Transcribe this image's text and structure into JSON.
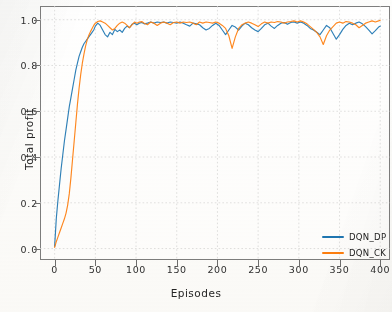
{
  "chart_data": {
    "type": "line",
    "title": "",
    "xlabel": "Episodes",
    "ylabel": "Total profit",
    "xlim": [
      -18,
      412
    ],
    "ylim": [
      -0.05,
      1.06
    ],
    "xticks": [
      0,
      50,
      100,
      150,
      200,
      250,
      300,
      350,
      400
    ],
    "xtick_labels": [
      "0",
      "50",
      "100",
      "150",
      "200",
      "250",
      "300",
      "350",
      "400"
    ],
    "yticks": [
      0.0,
      0.2,
      0.4,
      0.6,
      0.8,
      1.0
    ],
    "ytick_labels": [
      "0.0",
      "0.2",
      "0.4",
      "0.6",
      "0.8",
      "1.0"
    ],
    "grid": true,
    "legend_position": "lower right",
    "colors": {
      "series_1": "#1f77b4",
      "series_2": "#ff7f0e",
      "grid": "#d9d9d9",
      "axis": "#7e7e7e",
      "background": "#ffffff"
    },
    "series": [
      {
        "name": "DQN_DP",
        "color": "#1f77b4",
        "x": [
          0,
          2,
          4,
          6,
          8,
          10,
          12,
          14,
          16,
          18,
          20,
          22,
          24,
          26,
          28,
          30,
          32,
          34,
          36,
          38,
          40,
          42,
          44,
          46,
          48,
          50,
          53,
          56,
          59,
          62,
          65,
          68,
          71,
          74,
          77,
          80,
          83,
          86,
          89,
          92,
          95,
          98,
          101,
          104,
          107,
          110,
          114,
          118,
          122,
          126,
          130,
          134,
          138,
          142,
          146,
          150,
          154,
          158,
          162,
          166,
          170,
          174,
          178,
          182,
          186,
          190,
          194,
          198,
          202,
          206,
          210,
          214,
          218,
          222,
          226,
          230,
          234,
          238,
          242,
          246,
          250,
          254,
          258,
          262,
          266,
          270,
          274,
          278,
          282,
          286,
          290,
          294,
          298,
          302,
          306,
          310,
          314,
          318,
          322,
          326,
          330,
          334,
          338,
          342,
          346,
          350,
          354,
          358,
          362,
          366,
          370,
          374,
          378,
          382,
          386,
          390,
          394,
          398,
          400
        ],
        "y": [
          0.01,
          0.13,
          0.21,
          0.28,
          0.35,
          0.41,
          0.47,
          0.52,
          0.57,
          0.62,
          0.66,
          0.7,
          0.74,
          0.78,
          0.81,
          0.84,
          0.86,
          0.88,
          0.895,
          0.905,
          0.915,
          0.925,
          0.935,
          0.945,
          0.955,
          0.972,
          0.985,
          0.975,
          0.955,
          0.935,
          0.925,
          0.945,
          0.935,
          0.958,
          0.948,
          0.955,
          0.945,
          0.962,
          0.972,
          0.965,
          0.98,
          0.985,
          0.978,
          0.985,
          0.988,
          0.982,
          0.985,
          0.99,
          0.985,
          0.99,
          0.988,
          0.99,
          0.985,
          0.99,
          0.988,
          0.985,
          0.99,
          0.985,
          0.978,
          0.972,
          0.985,
          0.982,
          0.978,
          0.965,
          0.955,
          0.962,
          0.975,
          0.985,
          0.975,
          0.955,
          0.935,
          0.955,
          0.975,
          0.968,
          0.955,
          0.972,
          0.985,
          0.978,
          0.965,
          0.955,
          0.948,
          0.962,
          0.978,
          0.985,
          0.972,
          0.962,
          0.975,
          0.985,
          0.988,
          0.98,
          0.988,
          0.99,
          0.985,
          0.99,
          0.985,
          0.975,
          0.962,
          0.955,
          0.945,
          0.935,
          0.955,
          0.975,
          0.965,
          0.94,
          0.915,
          0.935,
          0.958,
          0.975,
          0.985,
          0.978,
          0.985,
          0.99,
          0.982,
          0.97,
          0.955,
          0.938,
          0.952,
          0.968,
          0.972
        ]
      },
      {
        "name": "DQN_CK",
        "color": "#ff7f0e",
        "x": [
          0,
          2,
          4,
          6,
          8,
          10,
          12,
          14,
          16,
          18,
          20,
          22,
          24,
          26,
          28,
          30,
          32,
          34,
          36,
          38,
          40,
          42,
          44,
          46,
          48,
          50,
          53,
          56,
          59,
          62,
          65,
          68,
          71,
          74,
          77,
          80,
          83,
          86,
          89,
          92,
          95,
          98,
          101,
          104,
          107,
          110,
          114,
          118,
          122,
          126,
          130,
          134,
          138,
          142,
          146,
          150,
          154,
          158,
          162,
          166,
          170,
          174,
          178,
          182,
          186,
          190,
          194,
          198,
          202,
          206,
          210,
          214,
          218,
          222,
          226,
          230,
          234,
          238,
          242,
          246,
          250,
          254,
          258,
          262,
          266,
          270,
          274,
          278,
          282,
          286,
          290,
          294,
          298,
          302,
          306,
          310,
          314,
          318,
          322,
          326,
          330,
          334,
          338,
          342,
          346,
          350,
          354,
          358,
          362,
          366,
          370,
          374,
          378,
          382,
          386,
          390,
          394,
          398,
          400
        ],
        "y": [
          0.005,
          0.03,
          0.05,
          0.07,
          0.09,
          0.11,
          0.13,
          0.155,
          0.19,
          0.24,
          0.31,
          0.39,
          0.47,
          0.55,
          0.63,
          0.7,
          0.76,
          0.81,
          0.85,
          0.885,
          0.912,
          0.932,
          0.948,
          0.962,
          0.975,
          0.985,
          0.992,
          0.995,
          0.99,
          0.985,
          0.975,
          0.965,
          0.955,
          0.962,
          0.975,
          0.985,
          0.99,
          0.985,
          0.975,
          0.965,
          0.978,
          0.99,
          0.985,
          0.99,
          0.992,
          0.985,
          0.978,
          0.99,
          0.985,
          0.975,
          0.985,
          0.99,
          0.985,
          0.978,
          0.988,
          0.99,
          0.985,
          0.99,
          0.988,
          0.99,
          0.985,
          0.978,
          0.99,
          0.985,
          0.99,
          0.988,
          0.985,
          0.99,
          0.985,
          0.975,
          0.962,
          0.93,
          0.875,
          0.925,
          0.962,
          0.978,
          0.985,
          0.99,
          0.985,
          0.978,
          0.97,
          0.982,
          0.99,
          0.985,
          0.99,
          0.988,
          0.992,
          0.99,
          0.985,
          0.99,
          0.992,
          0.995,
          0.99,
          0.995,
          0.99,
          0.982,
          0.97,
          0.958,
          0.945,
          0.925,
          0.892,
          0.93,
          0.955,
          0.97,
          0.985,
          0.99,
          0.985,
          0.992,
          0.99,
          0.985,
          0.978,
          0.965,
          0.975,
          0.985,
          0.99,
          0.995,
          0.99,
          0.995,
          0.998
        ]
      }
    ]
  },
  "legend": {
    "entries": [
      {
        "label": "DQN_DP",
        "color": "#1f77b4"
      },
      {
        "label": "DQN_CK",
        "color": "#ff7f0e"
      }
    ]
  },
  "axes": {
    "x_title": "Episodes",
    "y_title": "Total profit"
  }
}
